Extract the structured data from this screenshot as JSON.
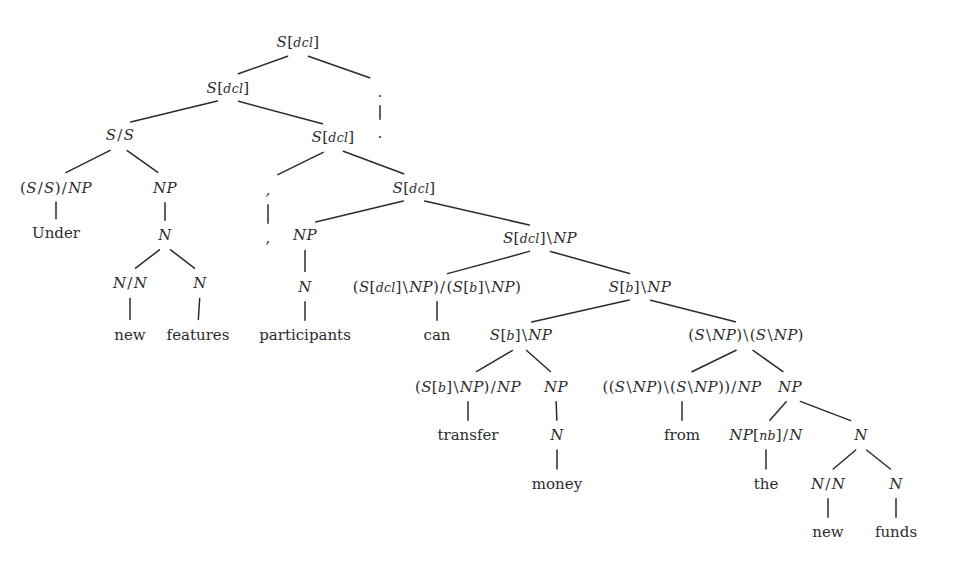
{
  "figure": {
    "type": "ccg-derivation-tree",
    "sentence": "Under new features , participants can transfer money from the new funds .",
    "ink_color": "#2b2b2f",
    "background": "#ffffff"
  },
  "nodes": [
    {
      "id": "n0",
      "label": "S[dcl]",
      "kind": "category",
      "x": 298,
      "y": 42
    },
    {
      "id": "n1",
      "label": "S[dcl]",
      "kind": "category",
      "x": 228,
      "y": 88
    },
    {
      "id": "n2",
      "label": ".",
      "kind": "category",
      "x": 380,
      "y": 92
    },
    {
      "id": "n3",
      "label": "S/S",
      "kind": "category",
      "x": 120,
      "y": 135
    },
    {
      "id": "n4",
      "label": "S[dcl]",
      "kind": "category",
      "x": 333,
      "y": 137
    },
    {
      "id": "n5",
      "label": ".",
      "kind": "terminal",
      "x": 380,
      "y": 133
    },
    {
      "id": "n6",
      "label": "(S/S)/NP",
      "kind": "category",
      "x": 56,
      "y": 188
    },
    {
      "id": "n7",
      "label": "NP",
      "kind": "category",
      "x": 165,
      "y": 188
    },
    {
      "id": "n8",
      "label": ",",
      "kind": "category",
      "x": 268,
      "y": 190
    },
    {
      "id": "n9",
      "label": "S[dcl]",
      "kind": "category",
      "x": 414,
      "y": 188
    },
    {
      "id": "n10",
      "label": "Under",
      "kind": "terminal",
      "x": 56,
      "y": 233
    },
    {
      "id": "n11",
      "label": "N",
      "kind": "category",
      "x": 165,
      "y": 235
    },
    {
      "id": "n12",
      "label": ",",
      "kind": "terminal",
      "x": 268,
      "y": 238
    },
    {
      "id": "n13",
      "label": "NP",
      "kind": "category",
      "x": 305,
      "y": 235
    },
    {
      "id": "n14",
      "label": "S[dcl]\\NP",
      "kind": "category",
      "x": 540,
      "y": 238
    },
    {
      "id": "n15",
      "label": "N/N",
      "kind": "category",
      "x": 130,
      "y": 283
    },
    {
      "id": "n16",
      "label": "N",
      "kind": "category",
      "x": 200,
      "y": 283
    },
    {
      "id": "n17",
      "label": "N",
      "kind": "category",
      "x": 305,
      "y": 287
    },
    {
      "id": "n18",
      "label": "(S[dcl]\\NP)/(S[b]\\NP)",
      "kind": "category",
      "x": 437,
      "y": 287
    },
    {
      "id": "n19",
      "label": "S[b]\\NP",
      "kind": "category",
      "x": 640,
      "y": 287
    },
    {
      "id": "n20",
      "label": "new",
      "kind": "terminal",
      "x": 130,
      "y": 335
    },
    {
      "id": "n21",
      "label": "features",
      "kind": "terminal",
      "x": 198,
      "y": 335
    },
    {
      "id": "n22",
      "label": "participants",
      "kind": "terminal",
      "x": 305,
      "y": 335
    },
    {
      "id": "n23",
      "label": "can",
      "kind": "terminal",
      "x": 437,
      "y": 335
    },
    {
      "id": "n24",
      "label": "S[b]\\NP",
      "kind": "category",
      "x": 521,
      "y": 335
    },
    {
      "id": "n25",
      "label": "(S\\NP)\\(S\\NP)",
      "kind": "category",
      "x": 746,
      "y": 335
    },
    {
      "id": "n26",
      "label": "(S[b]\\NP)/NP",
      "kind": "category",
      "x": 468,
      "y": 387
    },
    {
      "id": "n27",
      "label": "NP",
      "kind": "category",
      "x": 556,
      "y": 387
    },
    {
      "id": "n28",
      "label": "((S\\NP)\\(S\\NP))/NP",
      "kind": "category",
      "x": 682,
      "y": 387
    },
    {
      "id": "n29",
      "label": "NP",
      "kind": "category",
      "x": 790,
      "y": 387
    },
    {
      "id": "n30",
      "label": "transfer",
      "kind": "terminal",
      "x": 468,
      "y": 435
    },
    {
      "id": "n31",
      "label": "N",
      "kind": "category",
      "x": 557,
      "y": 435
    },
    {
      "id": "n32",
      "label": "from",
      "kind": "terminal",
      "x": 682,
      "y": 435
    },
    {
      "id": "n33",
      "label": "NP[nb]/N",
      "kind": "category",
      "x": 766,
      "y": 435
    },
    {
      "id": "n34",
      "label": "N",
      "kind": "category",
      "x": 861,
      "y": 435
    },
    {
      "id": "n35",
      "label": "money",
      "kind": "terminal",
      "x": 557,
      "y": 484
    },
    {
      "id": "n36",
      "label": "the",
      "kind": "terminal",
      "x": 766,
      "y": 484
    },
    {
      "id": "n37",
      "label": "N/N",
      "kind": "category",
      "x": 828,
      "y": 484
    },
    {
      "id": "n38",
      "label": "N",
      "kind": "category",
      "x": 896,
      "y": 484
    },
    {
      "id": "n39",
      "label": "new",
      "kind": "terminal",
      "x": 828,
      "y": 532
    },
    {
      "id": "n40",
      "label": "funds",
      "kind": "terminal",
      "x": 896,
      "y": 532
    }
  ],
  "edges": [
    {
      "from": "n0",
      "to": "n1"
    },
    {
      "from": "n0",
      "to": "n2"
    },
    {
      "from": "n1",
      "to": "n3"
    },
    {
      "from": "n1",
      "to": "n4"
    },
    {
      "from": "n2",
      "to": "n5"
    },
    {
      "from": "n3",
      "to": "n6"
    },
    {
      "from": "n3",
      "to": "n7"
    },
    {
      "from": "n4",
      "to": "n8"
    },
    {
      "from": "n4",
      "to": "n9"
    },
    {
      "from": "n6",
      "to": "n10"
    },
    {
      "from": "n7",
      "to": "n11"
    },
    {
      "from": "n8",
      "to": "n12"
    },
    {
      "from": "n9",
      "to": "n13"
    },
    {
      "from": "n9",
      "to": "n14"
    },
    {
      "from": "n11",
      "to": "n15"
    },
    {
      "from": "n11",
      "to": "n16"
    },
    {
      "from": "n13",
      "to": "n17"
    },
    {
      "from": "n14",
      "to": "n18"
    },
    {
      "from": "n14",
      "to": "n19"
    },
    {
      "from": "n15",
      "to": "n20"
    },
    {
      "from": "n16",
      "to": "n21"
    },
    {
      "from": "n17",
      "to": "n22"
    },
    {
      "from": "n18",
      "to": "n23"
    },
    {
      "from": "n19",
      "to": "n24"
    },
    {
      "from": "n19",
      "to": "n25"
    },
    {
      "from": "n24",
      "to": "n26"
    },
    {
      "from": "n24",
      "to": "n27"
    },
    {
      "from": "n25",
      "to": "n28"
    },
    {
      "from": "n25",
      "to": "n29"
    },
    {
      "from": "n26",
      "to": "n30"
    },
    {
      "from": "n27",
      "to": "n31"
    },
    {
      "from": "n28",
      "to": "n32"
    },
    {
      "from": "n29",
      "to": "n33"
    },
    {
      "from": "n29",
      "to": "n34"
    },
    {
      "from": "n31",
      "to": "n35"
    },
    {
      "from": "n33",
      "to": "n36"
    },
    {
      "from": "n34",
      "to": "n37"
    },
    {
      "from": "n34",
      "to": "n38"
    },
    {
      "from": "n37",
      "to": "n39"
    },
    {
      "from": "n38",
      "to": "n40"
    }
  ]
}
